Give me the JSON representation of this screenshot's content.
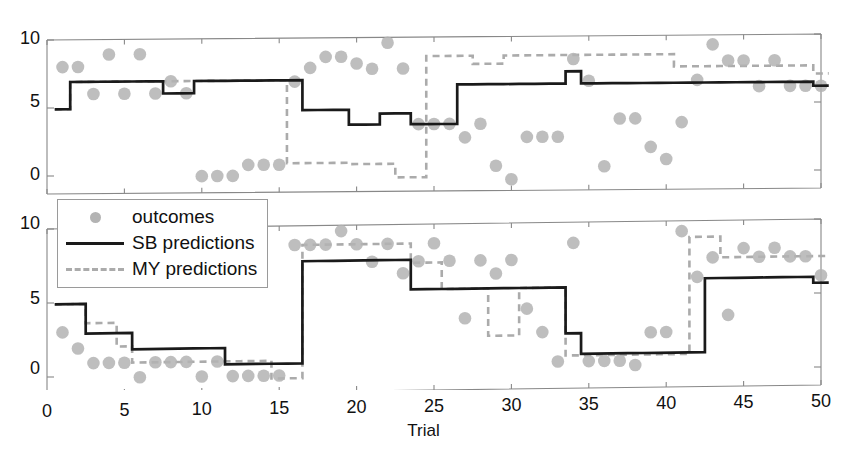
{
  "chart_data": {
    "type": "line",
    "title": "",
    "xlabel": "Trial",
    "ylabel": "",
    "xlim": [
      0,
      50
    ],
    "ylim": [
      -1,
      10.8
    ],
    "xticks": [
      0,
      5,
      10,
      15,
      20,
      25,
      30,
      35,
      40,
      45,
      50
    ],
    "xticklabels": [
      "0",
      "5",
      "10",
      "15",
      "20",
      "25",
      "30",
      "35",
      "40",
      "45",
      "50"
    ],
    "yticks": [
      0,
      5,
      10
    ],
    "yticklabels": [
      "0",
      "5",
      "10"
    ],
    "grid": false,
    "legend": {
      "position": "upper-left-of-bottom-panel",
      "entries": [
        {
          "label": "outcomes",
          "marker": "circle",
          "color": "#b3b3b3"
        },
        {
          "label": "SB predictions",
          "line": "solid",
          "color": "#1a1a1a"
        },
        {
          "label": "MY predictions",
          "line": "dashed",
          "color": "#ababab"
        }
      ]
    },
    "colors": {
      "outcomes": "#b3b3b3",
      "sb_predictions": "#1a1a1a",
      "my_predictions": "#ababab",
      "axis": "#888888",
      "text": "#111111"
    },
    "panels": [
      {
        "name": "top-panel",
        "x": [
          1,
          2,
          3,
          4,
          5,
          6,
          7,
          8,
          9,
          10,
          11,
          12,
          13,
          14,
          15,
          16,
          17,
          18,
          19,
          20,
          21,
          22,
          23,
          24,
          25,
          26,
          27,
          28,
          29,
          30,
          31,
          32,
          33,
          34,
          35,
          36,
          37,
          38,
          39,
          40,
          41,
          42,
          43,
          44,
          45,
          46,
          47,
          48,
          49,
          50
        ],
        "series": [
          {
            "name": "outcomes",
            "type": "scatter",
            "values": [
              8.0,
              8.0,
              6.0,
              8.9,
              6.0,
              8.9,
              6.0,
              6.9,
              6.0,
              -0.1,
              -0.1,
              -0.1,
              0.7,
              0.7,
              0.7,
              6.8,
              7.8,
              8.6,
              8.6,
              8.1,
              7.7,
              9.6,
              7.7,
              3.6,
              3.6,
              3.6,
              2.6,
              3.6,
              0.5,
              -0.5,
              2.6,
              2.6,
              2.6,
              8.3,
              6.7,
              0.4,
              3.9,
              3.9,
              1.8,
              0.9,
              3.6,
              6.7,
              9.3,
              8.1,
              8.1,
              6.2,
              8.1,
              6.2,
              6.2,
              6.2
            ]
          },
          {
            "name": "SB predictions",
            "type": "step",
            "values": [
              4.9,
              6.9,
              6.9,
              6.9,
              6.9,
              6.9,
              6.9,
              6.0,
              6.0,
              6.9,
              6.9,
              6.9,
              6.9,
              6.9,
              6.9,
              6.9,
              4.7,
              4.7,
              4.7,
              3.6,
              3.6,
              4.4,
              4.4,
              3.6,
              3.6,
              3.6,
              6.5,
              6.5,
              6.5,
              6.5,
              6.5,
              6.5,
              6.5,
              7.4,
              6.5,
              6.5,
              6.5,
              6.5,
              6.5,
              6.5,
              6.5,
              6.5,
              6.5,
              6.5,
              6.5,
              6.5,
              6.5,
              6.5,
              6.5,
              6.2
            ]
          },
          {
            "name": "MY predictions",
            "type": "step",
            "values": [
              4.9,
              6.9,
              6.9,
              6.9,
              6.9,
              6.9,
              6.9,
              6.9,
              6.9,
              6.9,
              6.9,
              6.9,
              6.9,
              6.9,
              6.9,
              0.8,
              0.8,
              0.8,
              0.8,
              0.7,
              0.7,
              0.7,
              -0.3,
              -0.3,
              8.6,
              8.6,
              8.6,
              8.0,
              8.0,
              8.6,
              8.6,
              8.6,
              8.6,
              8.6,
              8.6,
              8.6,
              8.6,
              8.6,
              8.6,
              8.6,
              7.7,
              7.7,
              7.7,
              7.7,
              7.7,
              7.7,
              7.7,
              7.7,
              7.7,
              7.1
            ]
          }
        ]
      },
      {
        "name": "bottom-panel",
        "x": [
          1,
          2,
          3,
          4,
          5,
          6,
          7,
          8,
          9,
          10,
          11,
          12,
          13,
          14,
          15,
          16,
          17,
          18,
          19,
          20,
          21,
          22,
          23,
          24,
          25,
          26,
          27,
          28,
          29,
          30,
          31,
          32,
          33,
          34,
          35,
          36,
          37,
          38,
          39,
          40,
          41,
          42,
          43,
          44,
          45,
          46,
          47,
          48,
          49,
          50
        ],
        "series": [
          {
            "name": "outcomes",
            "type": "scatter",
            "values": [
              3.0,
              1.9,
              0.9,
              0.9,
              0.9,
              -0.1,
              0.9,
              0.9,
              0.9,
              -0.1,
              0.9,
              -0.1,
              -0.1,
              -0.1,
              -0.1,
              8.7,
              8.7,
              8.7,
              9.6,
              8.7,
              7.5,
              8.7,
              6.7,
              7.5,
              8.7,
              7.5,
              3.6,
              7.5,
              6.6,
              7.5,
              4.2,
              2.6,
              0.6,
              8.6,
              0.6,
              0.6,
              0.6,
              0.3,
              2.5,
              2.5,
              9.3,
              6.2,
              7.5,
              3.6,
              8.1,
              7.5,
              8.1,
              7.5,
              7.5,
              6.2
            ]
          },
          {
            "name": "SB predictions",
            "type": "step",
            "values": [
              4.9,
              4.9,
              2.9,
              2.9,
              2.9,
              1.8,
              1.8,
              1.8,
              1.8,
              1.8,
              1.8,
              0.7,
              0.7,
              0.7,
              0.7,
              0.7,
              7.6,
              7.6,
              7.6,
              7.6,
              7.6,
              7.6,
              7.6,
              5.6,
              5.6,
              5.6,
              5.6,
              5.6,
              5.6,
              5.6,
              5.6,
              5.6,
              5.6,
              2.5,
              1.1,
              1.1,
              1.1,
              1.1,
              1.1,
              1.1,
              1.1,
              1.1,
              6.1,
              6.1,
              6.1,
              6.1,
              6.1,
              6.1,
              6.1,
              5.7
            ]
          },
          {
            "name": "MY predictions",
            "type": "step",
            "values": [
              4.9,
              4.9,
              3.6,
              3.6,
              2.0,
              0.9,
              0.9,
              0.9,
              0.9,
              0.9,
              0.9,
              0.9,
              0.9,
              0.9,
              -0.3,
              -0.3,
              8.7,
              8.7,
              8.7,
              8.7,
              8.7,
              8.7,
              8.7,
              7.4,
              7.4,
              5.6,
              5.6,
              5.6,
              2.4,
              2.4,
              5.6,
              5.6,
              5.6,
              1.0,
              1.0,
              1.0,
              1.0,
              1.0,
              1.0,
              1.0,
              1.0,
              8.9,
              8.9,
              7.5,
              7.5,
              7.5,
              7.5,
              7.5,
              7.5,
              7.5
            ]
          }
        ]
      }
    ]
  },
  "axes": {
    "top": {
      "yticklabels": [
        "10",
        "5",
        "0"
      ]
    },
    "bottom": {
      "yticklabels": [
        "10",
        "5",
        "0"
      ],
      "xticklabels": [
        "0",
        "5",
        "10",
        "15",
        "20",
        "25",
        "30",
        "35",
        "40",
        "45",
        "50"
      ],
      "xlabel": "Trial"
    }
  },
  "legend": {
    "outcomes_label": "outcomes",
    "sb_label": "SB predictions",
    "my_label": "MY predictions"
  }
}
